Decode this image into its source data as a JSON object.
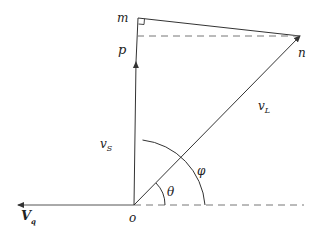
{
  "diagram": {
    "type": "phasor-vector-diagram",
    "points": {
      "o": {
        "label": "o",
        "x": 134,
        "y": 205
      },
      "p": {
        "label": "p",
        "x": 136,
        "y": 65
      },
      "m": {
        "label": "m",
        "x": 138,
        "y": 18
      },
      "n": {
        "label": "n",
        "x": 300,
        "y": 36
      }
    },
    "vectors": [
      {
        "name": "v_S",
        "label_main": "v",
        "label_sub": "S",
        "from": "o",
        "to": "p"
      },
      {
        "name": "v_L",
        "label_main": "v",
        "label_sub": "L",
        "from": "o",
        "to": "n"
      },
      {
        "name": "V_q",
        "label_main": "V",
        "label_sub": "q",
        "direction": "left"
      }
    ],
    "angles": [
      {
        "label": "θ",
        "between": [
          "horizontal axis",
          "v_L"
        ]
      },
      {
        "label": "φ",
        "between": [
          "horizontal axis",
          "v_S"
        ]
      }
    ],
    "dashed_lines": [
      "p–n horizontal",
      "o–right horizontal axis"
    ],
    "right_angle_marker": "m",
    "colors": {
      "stroke": "#333333",
      "text": "#222222"
    }
  }
}
